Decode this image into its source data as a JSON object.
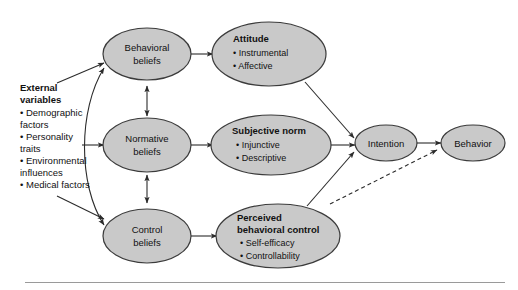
{
  "figure": {
    "background_color": "#ffffff",
    "node_fill": "#c9c9c9",
    "node_stroke": "#3b3b3b",
    "arrow_color": "#2b2b2b",
    "text_color": "#111111",
    "rule_color": "#9a9a9a"
  },
  "external": {
    "heading_line1": "External",
    "heading_line2": "variables",
    "items": [
      "• Demographic",
      "   factors",
      "• Personality",
      "   traits",
      "• Environmental",
      "   influences",
      "• Medical factors"
    ]
  },
  "nodes": {
    "behavioral_beliefs": {
      "line1": "Behavioral",
      "line2": "beliefs"
    },
    "normative_beliefs": {
      "line1": "Normative",
      "line2": "beliefs"
    },
    "control_beliefs": {
      "line1": "Control",
      "line2": "beliefs"
    },
    "attitude": {
      "title": "Attitude",
      "bullets": [
        "• Instrumental",
        "• Affective"
      ]
    },
    "subjective_norm": {
      "title": "Subjective norm",
      "bullets": [
        "• Injunctive",
        "• Descriptive"
      ]
    },
    "perceived_behavioral_control": {
      "title_line1": "Perceived",
      "title_line2": "behavioral control",
      "bullets": [
        "• Self-efficacy",
        "• Controllability"
      ]
    },
    "intention": {
      "label": "Intention"
    },
    "behavior": {
      "label": "Behavior"
    }
  }
}
